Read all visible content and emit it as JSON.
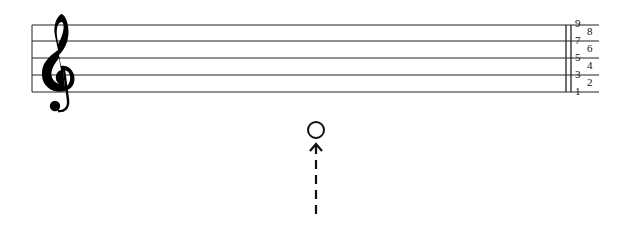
{
  "diagram": {
    "type": "music-staff",
    "clef": "treble-clef",
    "staff": {
      "line_count": 5,
      "line_y": [
        25,
        41,
        58,
        75,
        92
      ],
      "x_start": 32,
      "x_end": 599,
      "color": "#222222"
    },
    "barline": {
      "x1": 566,
      "x2": 571
    },
    "position_numbers": [
      {
        "label": "9",
        "x": 575,
        "y": 18
      },
      {
        "label": "8",
        "x": 587,
        "y": 26
      },
      {
        "label": "7",
        "x": 575,
        "y": 35
      },
      {
        "label": "6",
        "x": 587,
        "y": 43
      },
      {
        "label": "5",
        "x": 575,
        "y": 52
      },
      {
        "label": "4",
        "x": 587,
        "y": 60
      },
      {
        "label": "3",
        "x": 575,
        "y": 69
      },
      {
        "label": "2",
        "x": 587,
        "y": 77
      },
      {
        "label": "1",
        "x": 575,
        "y": 86
      }
    ],
    "note_marker": {
      "shape": "open-circle",
      "cx": 316,
      "cy": 130,
      "r": 8
    },
    "arrow": {
      "direction": "up",
      "style": "dashed",
      "x": 316,
      "y_top": 144,
      "y_bottom": 218
    }
  }
}
